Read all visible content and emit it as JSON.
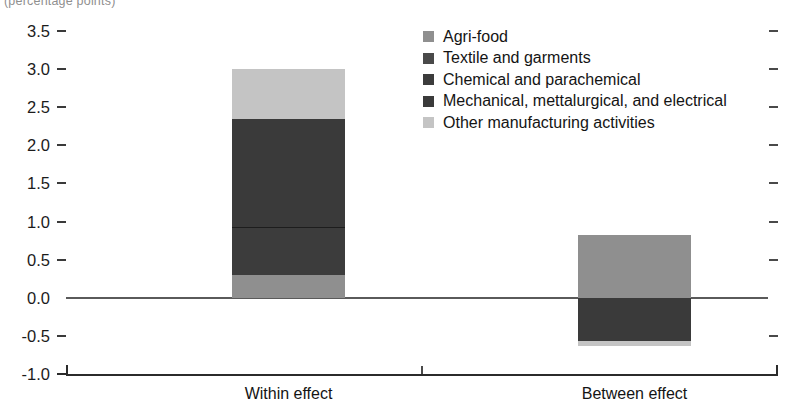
{
  "figure": {
    "clipped_top_text": "(percentage points)",
    "background_color": "#ffffff"
  },
  "axis": {
    "y_ticks": [
      "3.5",
      "3.0",
      "2.5",
      "2.0",
      "1.5",
      "1.0",
      "0.5",
      "0.0",
      "-0.5",
      "-1.0"
    ],
    "y_values": [
      3.5,
      3.0,
      2.5,
      2.0,
      1.5,
      1.0,
      0.5,
      0.0,
      -0.5,
      -1.0
    ],
    "y_min": -1.0,
    "y_max": 3.5,
    "zero_value": 0.0
  },
  "legend": {
    "position": "top-center-right",
    "items": [
      {
        "label": "Agri-food",
        "color": "#8f8f8f"
      },
      {
        "label": "Textile and garments",
        "color": "#4a4a4a"
      },
      {
        "label": "Chemical and parachemical",
        "color": "#3c3c3c"
      },
      {
        "label": "Mechanical, mettalurgical, and electrical",
        "color": "#3a3a3a"
      },
      {
        "label": "Other manufacturing activities",
        "color": "#c4c4c4"
      }
    ]
  },
  "categories": [
    {
      "label": "Within effect"
    },
    {
      "label": "Between effect"
    }
  ],
  "chart_data": {
    "type": "bar",
    "subtype": "stacked-bar",
    "title": "",
    "xlabel": "",
    "ylabel": "",
    "categories": [
      "Within effect",
      "Between effect"
    ],
    "ylim": [
      -1.0,
      3.5
    ],
    "yticks": [
      -1.0,
      -0.5,
      0.0,
      0.5,
      1.0,
      1.5,
      2.0,
      2.5,
      3.0,
      3.5
    ],
    "grid": false,
    "legend_position": "upper center",
    "series": [
      {
        "name": "Agri-food",
        "color": "#8f8f8f",
        "values": [
          0.3,
          0.83
        ]
      },
      {
        "name": "Textile and garments",
        "color": "#4a4a4a",
        "values": [
          0.0,
          0.0
        ]
      },
      {
        "name": "Chemical and parachemical",
        "color": "#3c3c3c",
        "values": [
          0.63,
          0.0
        ]
      },
      {
        "name": "Mechanical, mettalurgical, and electrical",
        "color": "#3a3a3a",
        "values": [
          1.42,
          -0.57
        ]
      },
      {
        "name": "Other manufacturing activities",
        "color": "#c4c4c4",
        "values": [
          0.65,
          -0.06
        ]
      }
    ],
    "totals": [
      3.0,
      0.2
    ],
    "positive_totals": [
      3.0,
      0.83
    ],
    "negative_totals": [
      0.0,
      -0.63
    ]
  },
  "bars": {
    "within": {
      "name": "Within effect",
      "segments": [
        {
          "series": "Other manufacturing activities",
          "color": "#c4c4c4",
          "from": 2.35,
          "to": 3.0
        },
        {
          "series": "Mechanical, mettalurgical, and electrical",
          "color": "#3a3a3a",
          "from": 0.93,
          "to": 2.35
        },
        {
          "series": "Chemical and parachemical",
          "color": "#3c3c3c",
          "from": 0.3,
          "to": 0.93
        },
        {
          "series": "Agri-food",
          "color": "#8f8f8f",
          "from": 0.0,
          "to": 0.3
        }
      ]
    },
    "between": {
      "name": "Between effect",
      "segments": [
        {
          "series": "Agri-food",
          "color": "#8f8f8f",
          "from": 0.0,
          "to": 0.83
        },
        {
          "series": "Mechanical, mettalurgical, and electrical",
          "color": "#3a3a3a",
          "from": -0.57,
          "to": 0.0
        },
        {
          "series": "Other manufacturing activities",
          "color": "#c4c4c4",
          "from": -0.63,
          "to": -0.57
        }
      ]
    }
  }
}
